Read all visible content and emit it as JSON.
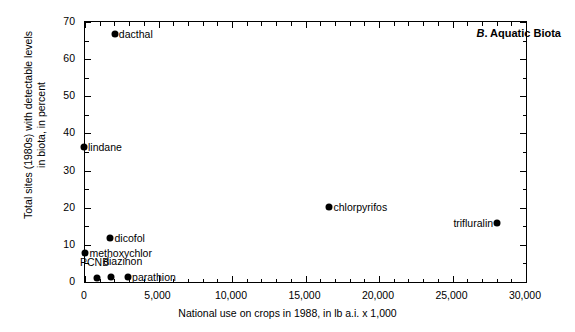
{
  "chart_data": {
    "type": "scatter",
    "title": "B. Aquatic Biota",
    "panel_letter": "B",
    "panel_name": ". Aquatic Biota",
    "xlabel": "National use on crops in 1988, in lb a.i. x 1,000",
    "ylabel_line1": "Total sites (1980s) with detectable levels",
    "ylabel_line2": "in biota, in percent",
    "xlim": [
      0,
      30000
    ],
    "ylim": [
      0,
      70
    ],
    "xticks": [
      0,
      5000,
      10000,
      15000,
      20000,
      25000,
      30000
    ],
    "xtick_labels": [
      "0",
      "5,000",
      "10,000",
      "15,000",
      "20,000",
      "25,000",
      "30,000"
    ],
    "yticks": [
      0,
      10,
      20,
      30,
      40,
      50,
      60,
      70
    ],
    "ytick_labels": [
      "0",
      "10",
      "20",
      "30",
      "40",
      "50",
      "60",
      "70"
    ],
    "x_minor_interval": 1000,
    "y_minor_interval": 5,
    "grid": false,
    "legend": false,
    "marker_color": "#000000",
    "points": [
      {
        "label": "dacthal",
        "x": 2100,
        "y": 66.5,
        "label_side": "right"
      },
      {
        "label": "lindane",
        "x": 0,
        "y": 36.0,
        "label_side": "right"
      },
      {
        "label": "chlorpyrifos",
        "x": 16700,
        "y": 20.0,
        "label_side": "right"
      },
      {
        "label": "trifluralin",
        "x": 28100,
        "y": 15.5,
        "label_side": "left"
      },
      {
        "label": "dicofol",
        "x": 1800,
        "y": 11.5,
        "label_side": "right"
      },
      {
        "label": "methoxychlor",
        "x": 100,
        "y": 7.5,
        "label_side": "right"
      },
      {
        "label": "PCNB",
        "x": 900,
        "y": 0.8,
        "label_side": "pcnb"
      },
      {
        "label": "diazinon",
        "x": 1850,
        "y": 1.0,
        "label_side": "diazinon"
      },
      {
        "label": "parathion",
        "x": 3000,
        "y": 1.0,
        "label_side": "right"
      }
    ]
  }
}
